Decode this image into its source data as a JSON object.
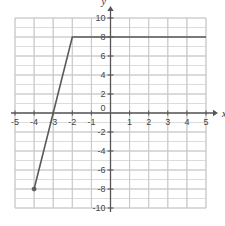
{
  "chart_data": {
    "type": "line",
    "title": "",
    "xlabel": "x",
    "ylabel": "y",
    "xlim": [
      -5,
      5
    ],
    "ylim": [
      -10,
      10
    ],
    "grid": true,
    "legend": null,
    "x_ticks": [
      -5,
      -4,
      -3,
      -2,
      -1,
      0,
      1,
      2,
      3,
      4,
      5
    ],
    "x_tick_labels": [
      "-5",
      "-4",
      "-3",
      "-2",
      "-1",
      "0",
      "1",
      "2",
      "3",
      "4",
      "5"
    ],
    "y_ticks": [
      -10,
      -8,
      -6,
      -4,
      -2,
      0,
      2,
      4,
      6,
      8,
      10
    ],
    "y_tick_labels": [
      "-10",
      "-8",
      "-6",
      "-4",
      "-2",
      "0",
      "2",
      "4",
      "6",
      "8",
      "10"
    ],
    "grid_step_x": 1,
    "grid_step_y": 1,
    "series": [
      {
        "name": "piecewise-function",
        "points": [
          {
            "x": -4,
            "y": -8
          },
          {
            "x": -2,
            "y": 8
          },
          {
            "x": 5,
            "y": 8
          }
        ],
        "endpoint_marker": {
          "x": -4,
          "y": -8,
          "style": "filled-dot"
        },
        "color": "#5a5a5a"
      }
    ],
    "colors": {
      "curve": "#5a5a5a",
      "axis": "#555555",
      "grid_minor": "#dcdcdc",
      "grid_major": "#c8c8c8",
      "tick_text": "#444444",
      "background": "#ffffff"
    }
  },
  "axis_labels": {
    "x": "x",
    "y": "y"
  }
}
